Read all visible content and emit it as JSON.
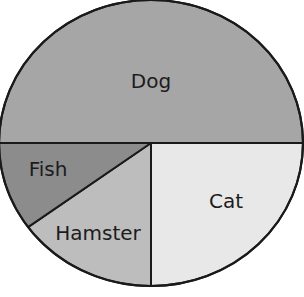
{
  "chart_data": {
    "type": "pie",
    "title": "",
    "categories": [
      "Dog",
      "Cat",
      "Hamster",
      "Fish"
    ],
    "values": [
      50,
      25,
      15,
      10
    ],
    "unit": "percent (estimated from slice angles)",
    "colors": {
      "Dog": "#a6a6a6",
      "Cat": "#e8e8e8",
      "Hamster": "#bdbdbd",
      "Fish": "#8c8c8c"
    },
    "labels_inside_slices": true,
    "legend": "none",
    "outline_color": "#1a1a1a"
  },
  "labels": {
    "dog": "Dog",
    "cat": "Cat",
    "hamster": "Hamster",
    "fish": "Fish"
  }
}
